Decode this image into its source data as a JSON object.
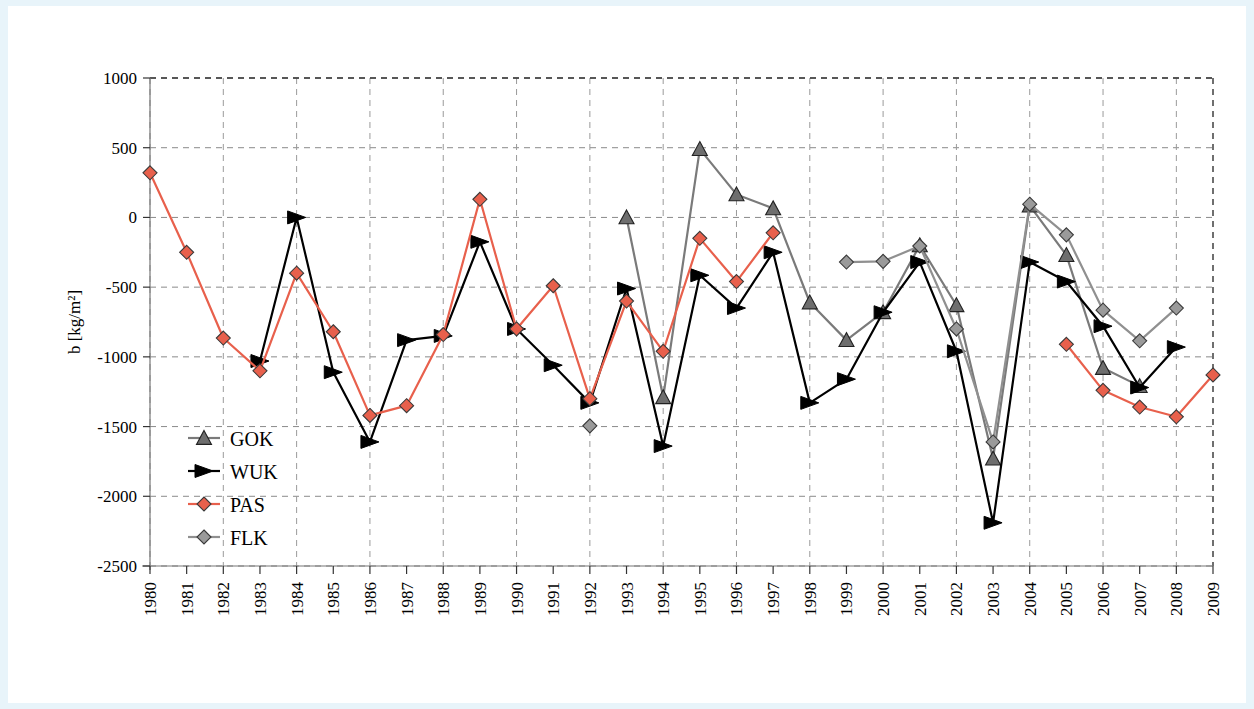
{
  "figure": {
    "background": "#ffffff",
    "page_background": "#e8f4fa",
    "ylabel": "b [kg/m²]"
  },
  "chart_data": {
    "type": "line",
    "title": "",
    "xlabel": "",
    "ylabel": "b [kg/m²]",
    "ylim": [
      -2500,
      1000
    ],
    "ytick_labels": [
      "1000",
      "500",
      "0",
      "-500",
      "-1000",
      "-1500",
      "-2000",
      "-2500"
    ],
    "yticks": [
      1000,
      500,
      0,
      -500,
      -1000,
      -1500,
      -2000,
      -2500
    ],
    "grid": true,
    "grid_style": "dashed",
    "legend_position": "inside-left",
    "x": [
      1980,
      1981,
      1982,
      1983,
      1984,
      1985,
      1986,
      1987,
      1988,
      1989,
      1990,
      1991,
      1992,
      1993,
      1994,
      1995,
      1996,
      1997,
      1998,
      1999,
      2000,
      2001,
      2002,
      2003,
      2004,
      2005,
      2006,
      2007,
      2008,
      2009
    ],
    "xtick_labels": [
      "1980",
      "1981",
      "1982",
      "1983",
      "1984",
      "1985",
      "1986",
      "1987",
      "1988",
      "1989",
      "1990",
      "1991",
      "1992",
      "1993",
      "1994",
      "1995",
      "1996",
      "1997",
      "1998",
      "1999",
      "2000",
      "2001",
      "2002",
      "2003",
      "2004",
      "2005",
      "2006",
      "2007",
      "2008",
      "2009"
    ],
    "series": [
      {
        "name": "GOK",
        "color": "#7a7a7a",
        "marker": "triangle",
        "marker_fill": "#6e6e6e",
        "values": [
          null,
          null,
          null,
          null,
          null,
          null,
          null,
          null,
          null,
          null,
          null,
          null,
          null,
          0,
          -1290,
          490,
          165,
          65,
          -610,
          -880,
          -680,
          -200,
          -630,
          -1730,
          85,
          -270,
          -1080,
          -1210,
          null,
          null
        ]
      },
      {
        "name": "WUK",
        "color": "#000000",
        "marker": "triangle-right",
        "marker_fill": "#000000",
        "values": [
          null,
          null,
          null,
          -1030,
          0,
          -1110,
          -1610,
          -880,
          -850,
          -175,
          -800,
          -1060,
          -1330,
          -510,
          -1640,
          -415,
          -650,
          -250,
          -1330,
          -1160,
          -680,
          -320,
          -960,
          -2190,
          -320,
          -460,
          -780,
          -1220,
          -930,
          null
        ]
      },
      {
        "name": "PAS",
        "color": "#e8604c",
        "marker": "diamond",
        "marker_fill": "#e8604c",
        "values": [
          320,
          -250,
          -865,
          -1100,
          -400,
          -820,
          -1420,
          -1350,
          -840,
          130,
          -800,
          -490,
          -1300,
          -600,
          -960,
          -150,
          -460,
          -110,
          null,
          null,
          null,
          null,
          null,
          null,
          null,
          -910,
          -1240,
          -1360,
          -1430,
          -1130
        ]
      },
      {
        "name": "FLK",
        "color": "#909090",
        "marker": "diamond",
        "marker_fill": "#9a9a9a",
        "values": [
          null,
          null,
          null,
          null,
          null,
          null,
          null,
          null,
          null,
          null,
          null,
          null,
          -1495,
          null,
          null,
          null,
          null,
          null,
          null,
          -320,
          -315,
          -205,
          -800,
          -1610,
          95,
          -125,
          -665,
          -885,
          -650,
          null
        ]
      }
    ]
  },
  "legend": {
    "items": [
      {
        "label": "GOK",
        "icon": "triangle-marker-icon"
      },
      {
        "label": "WUK",
        "icon": "triangle-right-marker-icon"
      },
      {
        "label": "PAS",
        "icon": "diamond-marker-icon"
      },
      {
        "label": "FLK",
        "icon": "diamond-marker-icon"
      }
    ]
  }
}
